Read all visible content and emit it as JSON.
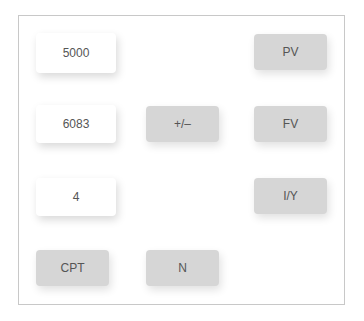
{
  "values": [
    {
      "id": "pv-value",
      "text": "5000"
    },
    {
      "id": "fv-value",
      "text": "6083"
    },
    {
      "id": "iy-value",
      "text": "4"
    }
  ],
  "keys": {
    "pv": "PV",
    "fv": "FV",
    "iy": "I/Y",
    "sign": "+/–",
    "cpt": "CPT",
    "n": "N"
  },
  "colors": {
    "key_bg": "#d6d6d6",
    "value_bg": "#ffffff",
    "border": "#c8c8c8",
    "text": "#555555"
  }
}
